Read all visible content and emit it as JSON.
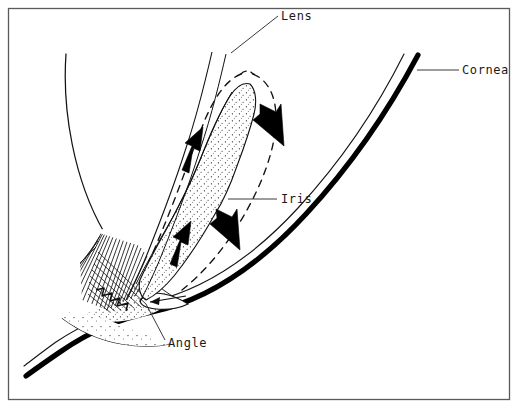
{
  "figure": {
    "kind": "anatomical-line-diagram",
    "width": 518,
    "height": 408,
    "background_color": "#ffffff",
    "ink_color": "#000000",
    "frame": {
      "present": true,
      "color": "#4a4a4a",
      "stroke_width": 1.2,
      "inset": 8
    }
  },
  "labels": {
    "lens": "Lens",
    "cornea": "Cornea",
    "iris": "Iris",
    "angle": "Angle"
  },
  "structures": [
    {
      "key": "lens",
      "label": "Lens",
      "description": "anterior lens capsule curve at upper left",
      "render": "thin-curve"
    },
    {
      "key": "cornea",
      "label": "Cornea",
      "description": "thick outer corneal curve with thin inner endothelial line at right",
      "render": "thick-curve-pair"
    },
    {
      "key": "iris",
      "label": "Iris",
      "description": "stippled wedge between lens and cornea, shown with dashed alternate bowed position",
      "render": "stippled-band-with-dashed-outline"
    },
    {
      "key": "angle",
      "label": "Angle",
      "description": "angle recess where iris root meets cornea and trabecular meshwork",
      "render": "recess"
    },
    {
      "key": "ciliary-body",
      "label": "",
      "description": "hatched fan-shaped ciliary body and zonules at left of angle",
      "render": "hatching"
    }
  ],
  "flow_arrows": [
    {
      "id": "arrow-upper-posterior",
      "direction": "up",
      "meaning": "posterior-to-anterior aqueous flow behind iris",
      "x": 186,
      "y": 148
    },
    {
      "id": "arrow-upper-anterior",
      "direction": "down",
      "meaning": "anterior chamber flow toward angle",
      "x": 268,
      "y": 128
    },
    {
      "id": "arrow-lower-posterior",
      "direction": "up",
      "meaning": "posterior-to-anterior aqueous flow behind iris",
      "x": 176,
      "y": 242
    },
    {
      "id": "arrow-lower-anterior",
      "direction": "down",
      "meaning": "anterior chamber flow toward angle",
      "x": 225,
      "y": 232
    },
    {
      "id": "arrow-angle-outflow",
      "direction": "left",
      "meaning": "aqueous outflow through the angle",
      "x": 150,
      "y": 303
    }
  ],
  "leaders": [
    {
      "key": "lens",
      "from_x": 278,
      "from_y": 16,
      "to_x": 231,
      "to_y": 53
    },
    {
      "key": "cornea",
      "from_x": 459,
      "from_y": 70,
      "to_x": 417,
      "to_y": 70
    },
    {
      "key": "iris",
      "from_x": 277,
      "from_y": 199,
      "to_x": 228,
      "to_y": 199
    },
    {
      "key": "angle",
      "from_x": 165,
      "from_y": 342,
      "to_x": 146,
      "to_y": 303
    }
  ],
  "label_positions": {
    "lens": {
      "x": 281,
      "y": 20
    },
    "cornea": {
      "x": 462,
      "y": 74
    },
    "iris": {
      "x": 281,
      "y": 203
    },
    "angle": {
      "x": 168,
      "y": 347
    }
  }
}
